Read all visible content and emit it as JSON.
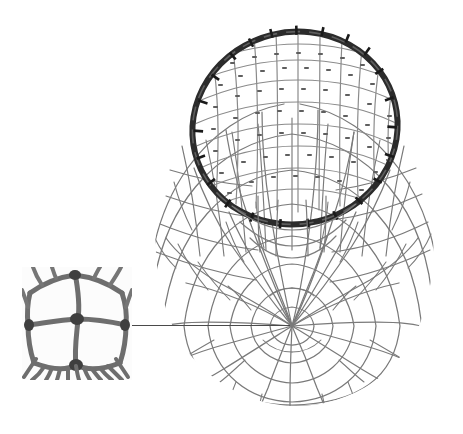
{
  "figure": {
    "kind": "photographic-illustration",
    "background_color": "#ffffff",
    "width": 463,
    "height": 434,
    "has_text_labels": false,
    "caption": ""
  },
  "net": {
    "name": "knotted mesh dip net",
    "hoop": {
      "label": "circular hoop rim",
      "color": "#2b2b2b",
      "center_x": 295,
      "center_y": 128,
      "radius_x": 103,
      "radius_y": 96,
      "rotation_deg": -14,
      "band_width": 6,
      "lashing_count": 24,
      "lashing_color": "#1a1a1a"
    },
    "bag": {
      "label": "net bag",
      "outline_color": "#6f6f6f",
      "strand_color": "#7a7a7a",
      "knot_color": "#4f4f4f",
      "left_x": 152,
      "right_x": 432,
      "top_y": 88,
      "bottom_y": 406,
      "center_x": 292,
      "center_y": 326,
      "radial_count": 34,
      "ring_count": 9
    },
    "mesh": {
      "label": "knotted diamond mesh",
      "strand_color": "#808080",
      "strand_width": 1.3,
      "knot_color": "#5a5a5a",
      "opening_fill": "#ffffff"
    }
  },
  "inset": {
    "name": "magnified mesh detail",
    "label": "",
    "left": 22,
    "top": 267,
    "width": 110,
    "height": 113,
    "border_color": "#d8d8d8",
    "background_color": "#fbfbfb",
    "strand_color": "#6e6e6e",
    "knot_color": "#3f3f3f",
    "openings": 4,
    "fringe_strands": 11
  },
  "leader": {
    "name": "detail leader line",
    "color": "#4a4a4a",
    "from_x": 132,
    "from_y": 325,
    "to_x": 290,
    "to_y": 325,
    "thickness": 1.4
  }
}
